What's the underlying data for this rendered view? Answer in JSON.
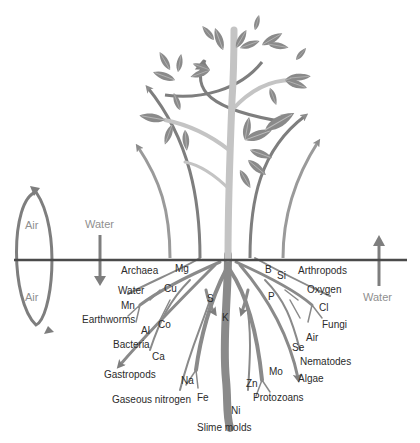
{
  "diagram": {
    "colors": {
      "ground_line": "#4a4a4a",
      "arrow": "#8c8c8c",
      "root": "#8a8a8a",
      "stem": "#c4c4c4",
      "leaf": "#8a8a8a",
      "text": "#2b2b2b",
      "secondary_text": "#909090"
    },
    "cycle_left": {
      "above_label": "Air",
      "below_label": "Air"
    },
    "flows": {
      "water_down_label": "Water",
      "water_up_label": "Water"
    },
    "labels_left": [
      "Archaea",
      "Water",
      "Mn",
      "Earthworms",
      "Bacteria",
      "Gastropods",
      "Gaseous nitrogen"
    ],
    "labels_elements_left": [
      "Mg",
      "Cu",
      "Co",
      "Al",
      "Ca",
      "Na",
      "Fe"
    ],
    "labels_center": [
      "S",
      "K",
      "Ni",
      "Zn",
      "Slime molds"
    ],
    "labels_elements_right": [
      "B",
      "Si",
      "P",
      "Cl",
      "Se",
      "Mo"
    ],
    "labels_right": [
      "Arthropods",
      "Oxygen",
      "Fungi",
      "Air",
      "Nematodes",
      "Algae",
      "Protozoans"
    ]
  }
}
